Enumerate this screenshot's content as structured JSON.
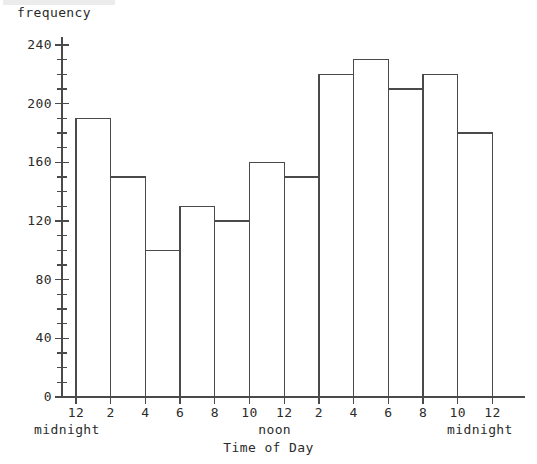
{
  "chart_data": {
    "type": "bar",
    "title": "",
    "xlabel": "Time of Day",
    "ylabel": "frequency",
    "ylim": [
      0,
      240
    ],
    "ytick_labels": [
      "0",
      "40",
      "80",
      "120",
      "160",
      "200",
      "240"
    ],
    "ytick_values": [
      0,
      40,
      80,
      120,
      160,
      200,
      240
    ],
    "y_minor_tick_step": 10,
    "grid": false,
    "legend": "none",
    "categories": [
      "12 midnight-2",
      "2-4",
      "4-6",
      "6-8",
      "8-10",
      "10-12 noon",
      "12 noon-2",
      "2-4",
      "4-6",
      "6-8",
      "8-10",
      "10-12 midnight"
    ],
    "xtick_labels": [
      "12",
      "2",
      "4",
      "6",
      "8",
      "10",
      "12",
      "2",
      "4",
      "6",
      "8",
      "10",
      "12"
    ],
    "xtick_values": [
      0,
      2,
      4,
      6,
      8,
      10,
      12,
      14,
      16,
      18,
      20,
      22,
      24
    ],
    "x_start_annotation": "midnight",
    "x_middle_annotation": "noon",
    "x_end_annotation": "midnight",
    "values": [
      190,
      150,
      100,
      130,
      120,
      160,
      150,
      220,
      230,
      210,
      220,
      180
    ],
    "bar_edge_color": "#4a4a4a",
    "bar_fill_color": "#ffffff",
    "axis_color": "#4a4a4a"
  }
}
